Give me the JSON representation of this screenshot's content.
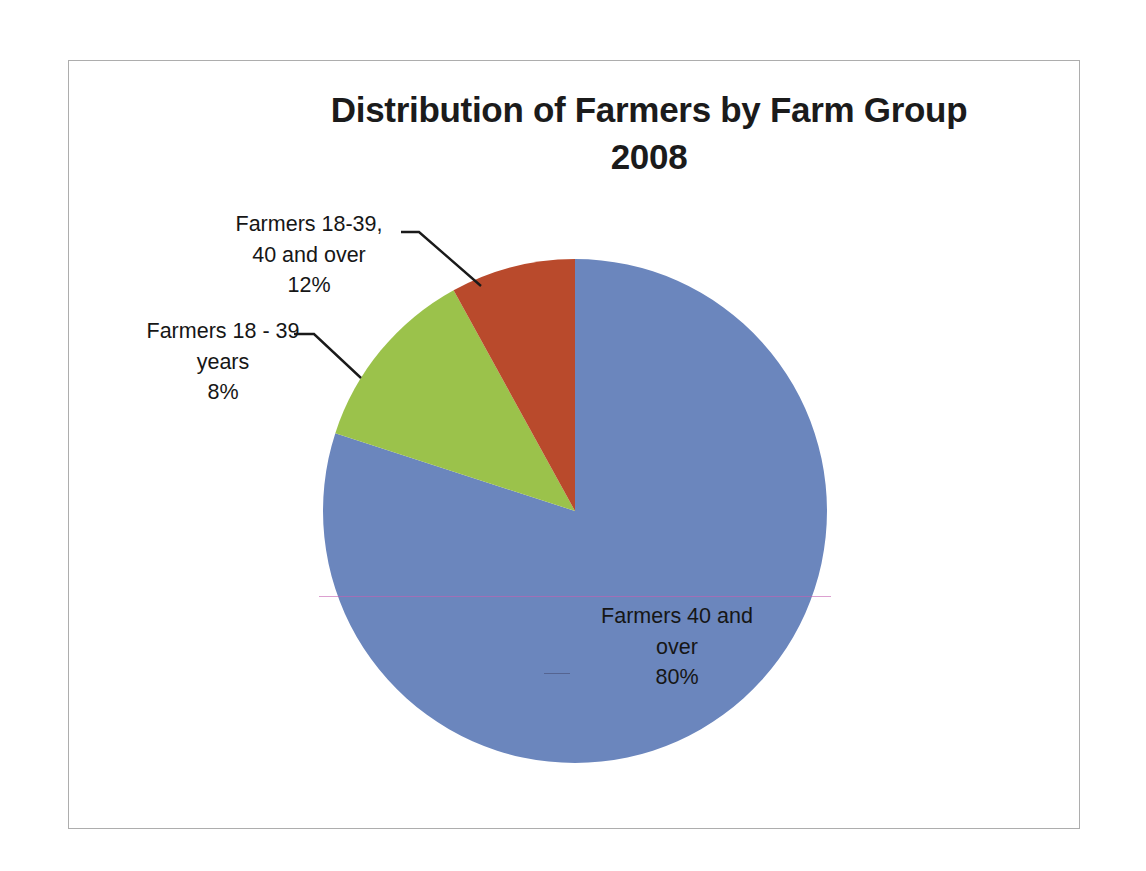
{
  "chart": {
    "title_line1": "Distribution of Farmers by Farm Group",
    "title_line2": "2008"
  },
  "labels": {
    "green": {
      "line1": "Farmers 18-39,",
      "line2": "40  and over",
      "line3": "12%"
    },
    "red": {
      "line1": "Farmers 18 - 39",
      "line2": "years",
      "line3": "8%"
    },
    "blue": {
      "line1": "Farmers 40 and",
      "line2": "over",
      "line3": "80%"
    }
  },
  "colors": {
    "blue": "#6b86bd",
    "green": "#9bc24b",
    "red": "#b94a2c",
    "frame": "#adadad",
    "leader": "#1a1a1a",
    "artifact": "#c460b0"
  },
  "chart_data": {
    "type": "pie",
    "title": "Distribution of Farmers by Farm Group 2008",
    "xlabel": "",
    "ylabel": "",
    "legend": "none",
    "grid": false,
    "start_angle_deg": 90,
    "direction": "clockwise",
    "categories": [
      "Farmers 40 and over",
      "Farmers 18-39, 40 and over",
      "Farmers 18 - 39 years"
    ],
    "values": [
      80,
      12,
      8
    ],
    "value_unit": "%",
    "slice_colors": [
      "#6b86bd",
      "#9bc24b",
      "#b94a2c"
    ],
    "data_labels": [
      "Farmers 40 and over 80%",
      "Farmers 18-39, 40 and over 12%",
      "Farmers 18 - 39 years 8%"
    ]
  }
}
